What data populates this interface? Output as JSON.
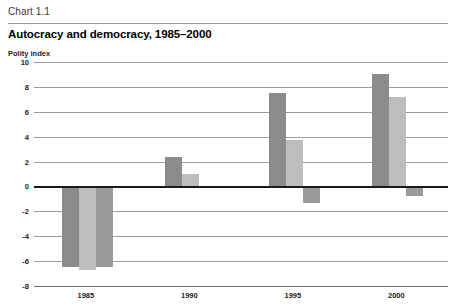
{
  "header": {
    "chart_number": "Chart 1.1",
    "title": "Autocracy and democracy, 1985–2000",
    "axis_unit": "Polity index"
  },
  "colors": {
    "series_1": "#8b8b8b",
    "series_2": "#bdbdbd",
    "series_3": "#9a9a9a",
    "gridline": "#9d9d9d",
    "zero_line": "#1a1a1a",
    "header_rule": "#9a9a9a"
  },
  "chart_data": {
    "type": "bar",
    "title": "Autocracy and democracy, 1985–2000",
    "subtitle": "Chart 1.1",
    "xlabel": "",
    "ylabel": "Polity index",
    "ylim": [
      -8,
      10
    ],
    "ytick_step": 2,
    "yticks": [
      10,
      8,
      6,
      4,
      2,
      0,
      -2,
      -4,
      -6,
      -8
    ],
    "ytick_labels": [
      "10",
      "8",
      "6",
      "4",
      "2",
      "0",
      "-2",
      "-4",
      "-6",
      "-8"
    ],
    "categories": [
      "1985",
      "1990",
      "1995",
      "2000"
    ],
    "grid": true,
    "legend": "none",
    "series": [
      {
        "name": "series-1",
        "color": "#8b8b8b",
        "values": [
          -6.5,
          2.4,
          7.5,
          9.0
        ]
      },
      {
        "name": "series-2",
        "color": "#bdbdbd",
        "values": [
          -6.7,
          1.0,
          3.7,
          7.2
        ]
      },
      {
        "name": "series-3",
        "color": "#9a9a9a",
        "values": [
          -6.5,
          0.0,
          -1.3,
          -0.8
        ]
      }
    ]
  }
}
